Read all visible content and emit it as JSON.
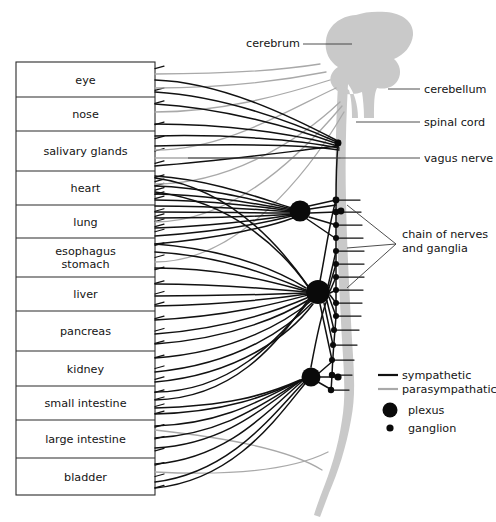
{
  "figure": {
    "background_color": "#ffffff"
  },
  "organ_box": {
    "x": 16,
    "y": 62,
    "width": 139,
    "height": 433,
    "border_color": "#2b2b2b",
    "rows": [
      {
        "label": "eye",
        "y_top": 62,
        "y_bottom": 97,
        "ports": 2
      },
      {
        "label": "nose",
        "y_top": 97,
        "y_bottom": 131,
        "ports": 2
      },
      {
        "label": "salivary glands",
        "y_top": 131,
        "y_bottom": 171,
        "ports": 3
      },
      {
        "label": "heart",
        "y_top": 171,
        "y_bottom": 205,
        "ports": 6
      },
      {
        "label": "lung",
        "y_top": 205,
        "y_bottom": 238,
        "ports": 5
      },
      {
        "label": "esophagus\nstomach",
        "y_top": 238,
        "y_bottom": 277,
        "ports": 3
      },
      {
        "label": "liver",
        "y_top": 277,
        "y_bottom": 311,
        "ports": 3
      },
      {
        "label": "pancreas",
        "y_top": 311,
        "y_bottom": 351,
        "ports": 3
      },
      {
        "label": "kidney",
        "y_top": 351,
        "y_bottom": 386,
        "ports": 3
      },
      {
        "label": "small intestine",
        "y_top": 386,
        "y_bottom": 420,
        "ports": 4
      },
      {
        "label": "large intestine",
        "y_top": 420,
        "y_bottom": 458,
        "ports": 3
      },
      {
        "label": "bladder",
        "y_top": 458,
        "y_bottom": 495,
        "ports": 3
      }
    ]
  },
  "anatomy_labels": [
    {
      "name": "cerebrum",
      "text": "cerebrum",
      "text_x": 246,
      "text_y": 47,
      "leader": {
        "x1": 303,
        "y1": 44,
        "x2": 352,
        "y2": 44
      }
    },
    {
      "name": "cerebellum",
      "text": "cerebellum",
      "text_x": 424,
      "text_y": 93,
      "leader": {
        "x1": 420,
        "y1": 89,
        "x2": 388,
        "y2": 89
      }
    },
    {
      "name": "spinal-cord",
      "text": "spinal cord",
      "text_x": 424,
      "text_y": 126,
      "leader": {
        "x1": 420,
        "y1": 122,
        "x2": 356,
        "y2": 122
      }
    },
    {
      "name": "vagus-nerve",
      "text": "vagus nerve",
      "text_x": 424,
      "text_y": 162,
      "leader": {
        "x1": 420,
        "y1": 158,
        "x2": 188,
        "y2": 158
      }
    }
  ],
  "chain_label": {
    "name": "chain-of-nerves-and-ganglia",
    "line1": "chain of nerves",
    "line2": "and ganglia",
    "text_x": 402,
    "text_y_line1": 238,
    "text_y_line2": 252,
    "apex_x": 396,
    "apex_y": 244,
    "targets": [
      {
        "x": 347,
        "y": 205
      },
      {
        "x": 347,
        "y": 248
      },
      {
        "x": 347,
        "y": 288
      }
    ]
  },
  "legend": {
    "x": 378,
    "items": [
      {
        "name": "legend-sympathetic",
        "label": "sympathetic",
        "type": "line",
        "color": "#111111",
        "y": 379,
        "label_x": 402
      },
      {
        "name": "legend-parasympathetic",
        "label": "parasympathatic",
        "type": "line",
        "color": "#a9a9a9",
        "y": 393,
        "label_x": 402
      },
      {
        "name": "legend-plexus",
        "label": "plexus",
        "type": "circle",
        "color": "#0a0a0a",
        "y": 414,
        "radius": 7.5,
        "cx": 390,
        "label_x": 408
      },
      {
        "name": "legend-ganglion",
        "label": "ganglion",
        "type": "circle",
        "color": "#0a0a0a",
        "y": 432,
        "radius": 3.6,
        "cx": 390,
        "label_x": 408
      }
    ]
  },
  "cns": {
    "color": "#c9c9c9",
    "brain_path": "M 352,18 C 336,20 326,32 328,46 C 329,57 335,64 341,68 C 336,72 333,77 334,82 C 336,90 343,94 351,94 L 356,94 C 358,100 360,108 360,117 L 372,117 C 372,105 372,96 374,90 C 382,92 390,90 394,84 C 399,77 397,68 392,63 C 402,60 410,52 412,42 C 414,28 402,17 386,15 C 374,13 361,14 352,18 Z",
    "cord_path": "M 349,92 C 346,120 345,160 346,200 C 347,250 350,300 352,340 C 354,372 356,396 352,420 C 348,446 340,470 332,490 C 328,500 325,508 323,514",
    "cord_width_top": 20,
    "cord_width_bottom": 3
  },
  "sympathetic_chain": {
    "trunk_x": 346,
    "ganglia": [
      {
        "x": 338,
        "y": 143,
        "r": 3.2
      },
      {
        "x": 336,
        "y": 200,
        "r": 3.4
      },
      {
        "x": 336,
        "y": 212,
        "r": 3.2
      },
      {
        "x": 336,
        "y": 225,
        "r": 3.0
      },
      {
        "x": 336,
        "y": 238,
        "r": 3.0
      },
      {
        "x": 336,
        "y": 251,
        "r": 3.0
      },
      {
        "x": 336,
        "y": 264,
        "r": 3.0
      },
      {
        "x": 336,
        "y": 277,
        "r": 3.0
      },
      {
        "x": 336,
        "y": 290,
        "r": 3.0
      },
      {
        "x": 336,
        "y": 303,
        "r": 3.0
      },
      {
        "x": 336,
        "y": 316,
        "r": 3.0
      },
      {
        "x": 334,
        "y": 330,
        "r": 3.0
      },
      {
        "x": 333,
        "y": 345,
        "r": 3.0
      },
      {
        "x": 332,
        "y": 360,
        "r": 3.0
      },
      {
        "x": 332,
        "y": 375,
        "r": 3.2
      },
      {
        "x": 331,
        "y": 390,
        "r": 3.2
      }
    ],
    "rami": [
      {
        "y": 200,
        "x1": 336,
        "x2": 360
      },
      {
        "y": 212,
        "x1": 336,
        "x2": 361
      },
      {
        "y": 225,
        "x1": 336,
        "x2": 362
      },
      {
        "y": 238,
        "x1": 336,
        "x2": 363
      },
      {
        "y": 251,
        "x1": 336,
        "x2": 364
      },
      {
        "y": 264,
        "x1": 336,
        "x2": 364
      },
      {
        "y": 277,
        "x1": 336,
        "x2": 364
      },
      {
        "y": 290,
        "x1": 336,
        "x2": 363
      },
      {
        "y": 303,
        "x1": 336,
        "x2": 362
      },
      {
        "y": 316,
        "x1": 336,
        "x2": 361
      },
      {
        "y": 330,
        "x1": 334,
        "x2": 359
      },
      {
        "y": 345,
        "x1": 333,
        "x2": 357
      },
      {
        "y": 360,
        "x1": 332,
        "x2": 354
      },
      {
        "y": 375,
        "x1": 332,
        "x2": 352
      },
      {
        "y": 390,
        "x1": 331,
        "x2": 349
      }
    ]
  },
  "plexuses": [
    {
      "name": "plexus-cardiopulmonary",
      "cx": 300,
      "cy": 211,
      "r": 10.5
    },
    {
      "name": "plexus-celiac",
      "cx": 318,
      "cy": 292,
      "r": 12.0
    },
    {
      "name": "plexus-hypogastric",
      "cx": 311,
      "cy": 377,
      "r": 9.5
    }
  ],
  "small_nodes": [
    {
      "name": "node-vagus-junction",
      "cx": 338,
      "cy": 143,
      "r": 3.4
    },
    {
      "name": "node-chain-upper",
      "cx": 341,
      "cy": 211,
      "r": 3.4
    },
    {
      "name": "node-chain-lower",
      "cx": 338,
      "cy": 377,
      "r": 3.6
    }
  ]
}
